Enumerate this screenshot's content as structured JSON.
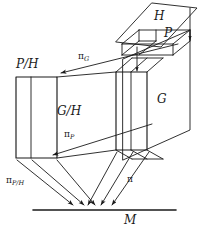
{
  "figure": {
    "kind": "commutative-fibre-bundle-diagram",
    "width": 202,
    "height": 231,
    "stroke_color": "#1a1a1a",
    "background": "#ffffff"
  },
  "labels": {
    "H": "H",
    "P": "P",
    "G": "G",
    "P_over_H": "P/H",
    "G_over_H": "G/H",
    "M": "M"
  },
  "maps": {
    "pi": "π",
    "pi_G_base": "π",
    "pi_G_sub": "G",
    "pi_P_base": "π",
    "pi_P_sub": "P",
    "pi_PH_base": "π",
    "pi_PH_sub": "P/H"
  },
  "geometry": {
    "H_plane": "152,3 197,8 161,46 116,41",
    "P_top_face": "139,38 190,38 190,30 139,30",
    "G_plane": "123,60 190,30 190,130 123,160",
    "G_box_front": "116,72 147,72 147,150 116,150",
    "PH_box_front": "16,77 57,77 57,158 16,158",
    "M_line": {
      "x1": 33,
      "y1": 210,
      "x2": 176,
      "y2": 210
    }
  },
  "arrows": {
    "pi_G": {
      "from": [
        176,
        44
      ],
      "to": [
        62,
        72
      ]
    },
    "pi_P": {
      "from": [
        151,
        125
      ],
      "to": [
        54,
        155
      ]
    },
    "vertical_right": {
      "from": [
        190,
        8
      ],
      "to": [
        190,
        40
      ]
    },
    "vertical_inner": {
      "from": [
        137,
        48
      ],
      "to": [
        137,
        72
      ]
    },
    "to_M": [
      {
        "from": [
          17,
          159
        ],
        "to": [
          74,
          206
        ]
      },
      {
        "from": [
          32,
          159
        ],
        "to": [
          84,
          206
        ]
      },
      {
        "from": [
          57,
          159
        ],
        "to": [
          96,
          206
        ]
      },
      {
        "from": [
          117,
          152
        ],
        "to": [
          88,
          206
        ]
      },
      {
        "from": [
          133,
          152
        ],
        "to": [
          101,
          206
        ]
      },
      {
        "from": [
          149,
          152
        ],
        "to": [
          112,
          206
        ]
      }
    ]
  }
}
